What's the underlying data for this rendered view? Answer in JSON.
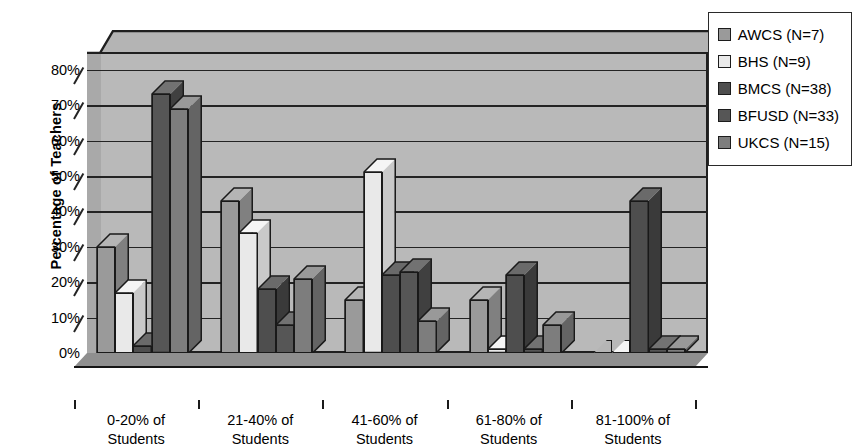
{
  "chart_data": {
    "type": "bar",
    "title": "",
    "subtitle": "",
    "xlabel": "",
    "ylabel": "Percentage of Teachers",
    "ylim": [
      0,
      85
    ],
    "grid": true,
    "legend_position": "top-right",
    "style": "3d-clustered-column",
    "categories": [
      "0-20% of\nStudents",
      "21-40% of\nStudents",
      "41-60% of\nStudents",
      "61-80% of\nStudents",
      "81-100% of\nStudents"
    ],
    "category_lines": [
      [
        "0-20% of",
        "Students"
      ],
      [
        "21-40% of",
        "Students"
      ],
      [
        "41-60% of",
        "Students"
      ],
      [
        "61-80% of",
        "Students"
      ],
      [
        "81-100% of",
        "Students"
      ]
    ],
    "ytick_labels": [
      "0%",
      "10%",
      "20%",
      "30%",
      "40%",
      "50%",
      "60%",
      "70%",
      "80%"
    ],
    "ytick_values": [
      0,
      10,
      20,
      30,
      40,
      50,
      60,
      70,
      80
    ],
    "series": [
      {
        "name": "AWCS (N=7)",
        "color": "#9a9a9a",
        "top_color": "#b5b5b5",
        "side_color": "#808080",
        "values": [
          30,
          43,
          15,
          15,
          0
        ]
      },
      {
        "name": "BHS (N=9)",
        "color": "#e9e9e9",
        "top_color": "#f5f5f5",
        "side_color": "#c9c9c9",
        "values": [
          17,
          34,
          51,
          1,
          0
        ]
      },
      {
        "name": "BMCS (N=38)",
        "color": "#4e4e4e",
        "top_color": "#6a6a6a",
        "side_color": "#3a3a3a",
        "values": [
          2,
          18,
          22,
          22,
          43
        ]
      },
      {
        "name": "BFUSD (N=33)",
        "color": "#565656",
        "top_color": "#727272",
        "side_color": "#404040",
        "values": [
          73,
          8,
          23,
          1,
          1
        ]
      },
      {
        "name": "UKCS (N=15)",
        "color": "#7d7d7d",
        "top_color": "#999999",
        "side_color": "#646464",
        "values": [
          69,
          21,
          9,
          8,
          1
        ]
      }
    ]
  },
  "legend": {
    "entries": [
      {
        "label": "AWCS (N=7)",
        "color": "#9a9a9a"
      },
      {
        "label": "BHS (N=9)",
        "color": "#e9e9e9"
      },
      {
        "label": "BMCS (N=38)",
        "color": "#4e4e4e"
      },
      {
        "label": "BFUSD (N=33)",
        "color": "#565656"
      },
      {
        "label": "UKCS (N=15)",
        "color": "#7d7d7d"
      }
    ]
  },
  "colors": {
    "plot_background": "#b9b9b9",
    "floor": "#8f8f8f",
    "axis": "#1a1a1a",
    "legend_background": "#ffffff",
    "page_background": "#ffffff"
  }
}
